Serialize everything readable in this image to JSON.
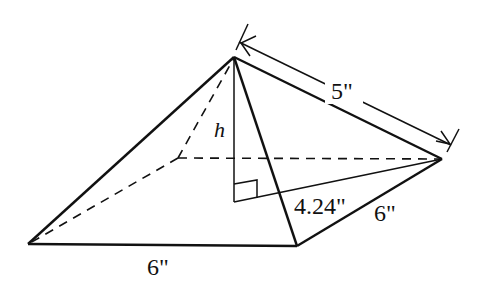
{
  "diagram": {
    "labels": {
      "slant_edge": "5\"",
      "height": "h",
      "half_diagonal": "4.24\"",
      "base_side_right": "6\"",
      "base_side_front": "6\""
    },
    "colors": {
      "stroke": "#111111",
      "background": "#ffffff"
    }
  }
}
